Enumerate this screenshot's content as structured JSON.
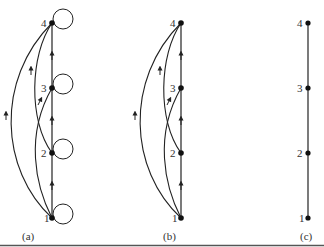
{
  "figure": {
    "panels": [
      {
        "id": "a",
        "caption": "(a)",
        "nodes": [
          "1",
          "2",
          "3",
          "4"
        ],
        "edges": [
          "1→2",
          "2→3",
          "3→4",
          "1→3",
          "2→4",
          "1→4"
        ],
        "self_loops": [
          "1",
          "2",
          "3",
          "4"
        ]
      },
      {
        "id": "b",
        "caption": "(b)",
        "nodes": [
          "1",
          "2",
          "3",
          "4"
        ],
        "edges": [
          "1→2",
          "2→3",
          "3→4",
          "1→3",
          "2→4",
          "1→4"
        ],
        "self_loops": []
      },
      {
        "id": "c",
        "caption": "(c)",
        "nodes": [
          "1",
          "2",
          "3",
          "4"
        ],
        "edges": [
          "1—2",
          "2—3",
          "3—4"
        ],
        "self_loops": []
      }
    ],
    "colors": {
      "ink": "#222222",
      "rule": "#555555"
    }
  }
}
